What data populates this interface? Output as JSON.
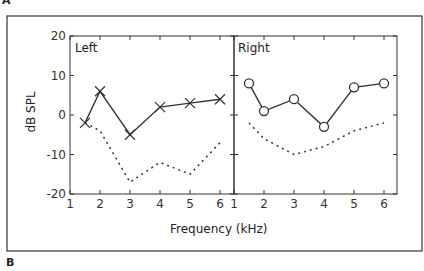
{
  "figure": {
    "label_top": "A",
    "label_bottom": "B"
  },
  "chart_data": {
    "type": "line",
    "xlabel": "Frequency (kHz)",
    "ylabel": "dB SPL",
    "ylim": [
      -20,
      20
    ],
    "yticks": [
      "20",
      "10",
      "0",
      "-10",
      "-20"
    ],
    "xticks": [
      "1",
      "2",
      "3",
      "4",
      "5",
      "6"
    ],
    "xlim": [
      1,
      6.5
    ],
    "panels": [
      {
        "title": "Left",
        "series": [
          {
            "name": "measured",
            "marker": "x",
            "style": "solid",
            "x": [
              1.5,
              2,
              3,
              4,
              5,
              6
            ],
            "values": [
              -2,
              6,
              -5,
              2,
              3,
              4
            ]
          },
          {
            "name": "baseline",
            "style": "dotted",
            "x": [
              1.5,
              2,
              3,
              4,
              5,
              6
            ],
            "values": [
              -2,
              -4,
              -17,
              -12,
              -15,
              -7
            ]
          }
        ]
      },
      {
        "title": "Right",
        "series": [
          {
            "name": "measured",
            "marker": "o",
            "style": "solid",
            "x": [
              1.5,
              2,
              3,
              4,
              5,
              6
            ],
            "values": [
              8,
              1,
              4,
              -3,
              7,
              8
            ]
          },
          {
            "name": "baseline",
            "style": "dotted",
            "x": [
              1.5,
              2,
              3,
              4,
              5,
              6
            ],
            "values": [
              -2,
              -6,
              -10,
              -8,
              -4,
              -2
            ]
          }
        ]
      }
    ]
  }
}
